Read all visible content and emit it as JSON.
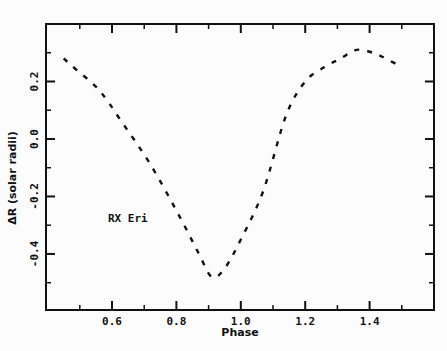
{
  "chart_data": {
    "type": "line",
    "title": "",
    "xlabel": "Phase",
    "ylabel": "ΔR (solar radii)",
    "xlim": [
      0.395,
      1.6
    ],
    "ylim": [
      -0.595,
      0.4
    ],
    "x_ticks": [
      0.6,
      0.8,
      1.0,
      1.2,
      1.4
    ],
    "x_tick_labels": [
      "0.6",
      "0.8",
      "1.0",
      "1.2",
      "1.4"
    ],
    "x_minor_ticks": [
      0.5,
      0.7,
      0.9,
      1.1,
      1.3,
      1.5
    ],
    "y_ticks": [
      0.2,
      0.0,
      -0.2,
      -0.4
    ],
    "y_tick_labels": [
      "0.2",
      "0.0",
      "-0.2",
      "-0.4"
    ],
    "y_minor_ticks": [
      0.3,
      0.1,
      -0.1,
      -0.3,
      -0.5
    ],
    "grid": false,
    "legend": null,
    "annotations": [
      {
        "text": "RX Eri",
        "x": 0.6,
        "y": -0.29
      }
    ],
    "series": [
      {
        "name": "RX Eri",
        "line_style": "dashed",
        "color": "#111111",
        "x": [
          0.45,
          0.49,
          0.56,
          0.63,
          0.72,
          0.81,
          0.87,
          0.91,
          0.95,
          1.0,
          1.07,
          1.14,
          1.2,
          1.26,
          1.31,
          1.36,
          1.41,
          1.45,
          1.5
        ],
        "y": [
          0.28,
          0.24,
          0.17,
          0.06,
          -0.09,
          -0.27,
          -0.4,
          -0.48,
          -0.45,
          -0.35,
          -0.18,
          0.08,
          0.2,
          0.25,
          0.28,
          0.31,
          0.3,
          0.28,
          0.25
        ]
      }
    ]
  },
  "labels": {
    "xlabel": "Phase",
    "ylabel": "ΔR (solar radii)",
    "annotation": "RX Eri"
  }
}
